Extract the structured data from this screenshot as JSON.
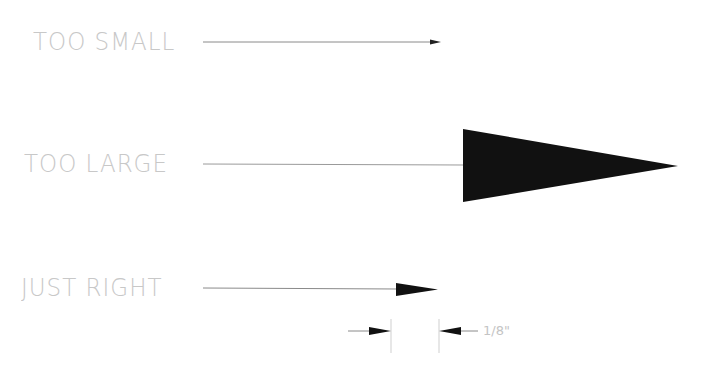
{
  "labels": {
    "too_small": "TOO SMALL",
    "too_large": "TOO LARGE",
    "just_right": "JUST RIGHT",
    "dimension": "1/8\""
  },
  "colors": {
    "text": "#c8c8c8",
    "line": "#7a7a7a",
    "arrowhead": "#111111"
  }
}
